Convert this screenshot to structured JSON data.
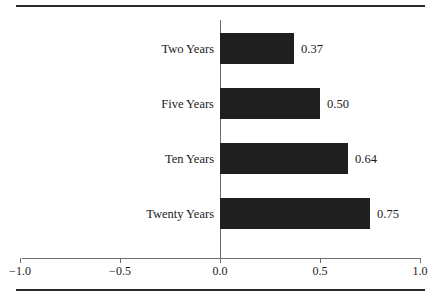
{
  "chart_data": {
    "type": "bar",
    "orientation": "horizontal",
    "title": "",
    "subtitle": "",
    "xlabel": "",
    "ylabel": "",
    "categories": [
      "Two Years",
      "Five Years",
      "Ten Years",
      "Twenty Years"
    ],
    "values": [
      0.37,
      0.5,
      0.64,
      0.75
    ],
    "value_labels": [
      "0.37",
      "0.50",
      "0.64",
      "0.75"
    ],
    "xlim": [
      -1.0,
      1.0
    ],
    "xticks": [
      -1.0,
      -0.5,
      0.0,
      0.5,
      1.0
    ],
    "xtick_labels": [
      "−1.0",
      "−0.5",
      "0.0",
      "0.5",
      "1.0"
    ],
    "grid": false,
    "legend": null,
    "bar_color": "#201f1f",
    "axis_color": "#6e6e6e",
    "rule_color": "#2b2b2b",
    "background": "#ffffff",
    "series": [
      {
        "name": "",
        "values": [
          0.37,
          0.5,
          0.64,
          0.75
        ]
      }
    ],
    "bars": [
      {
        "category": "Two Years",
        "value": 0.37,
        "label": "0.37"
      },
      {
        "category": "Five Years",
        "value": 0.5,
        "label": "0.50"
      },
      {
        "category": "Ten Years",
        "value": 0.64,
        "label": "0.64"
      },
      {
        "category": "Twenty Years",
        "value": 0.75,
        "label": "0.75"
      }
    ]
  }
}
